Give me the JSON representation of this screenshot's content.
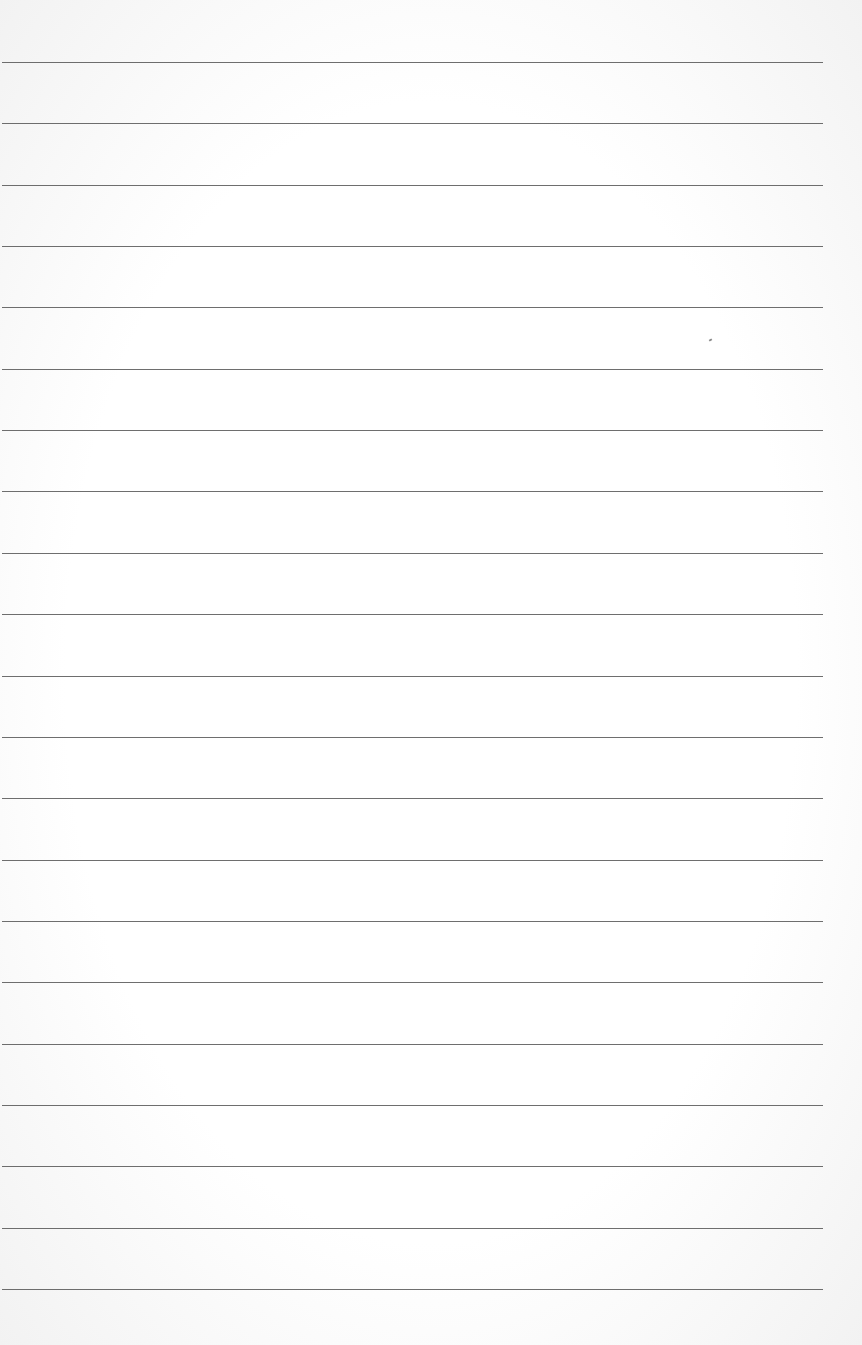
{
  "page": {
    "type": "lined-paper",
    "background_color": "#ffffff",
    "rule_color": "#555555",
    "rule_count": 21,
    "first_rule_y": 62,
    "rule_spacing": 61.35,
    "rule_left": 2,
    "rule_right": 823
  }
}
